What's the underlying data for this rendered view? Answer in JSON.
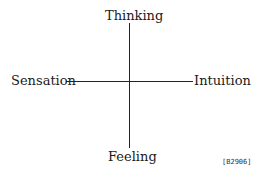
{
  "diagram": {
    "axes": {
      "top": "Thinking",
      "bottom": "Feeling",
      "left": "Sensation",
      "right": "Intuition"
    },
    "figure_id": "[B2906]"
  }
}
